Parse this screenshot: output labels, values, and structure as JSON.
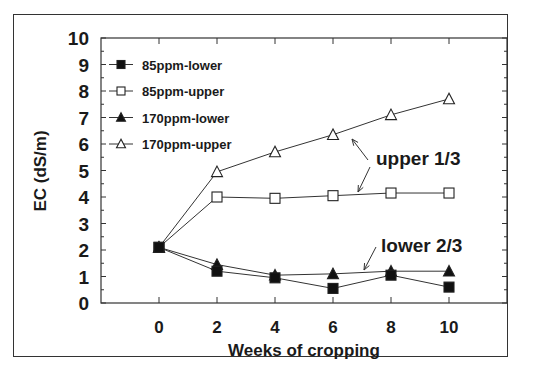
{
  "chart_data": {
    "type": "line",
    "title": "",
    "xlabel": "Weeks of cropping",
    "ylabel": "EC (dS/m)",
    "x": [
      0,
      2,
      4,
      6,
      8,
      10
    ],
    "xticks": [
      "0",
      "2",
      "4",
      "6",
      "8",
      "10"
    ],
    "yticks": [
      "0",
      "1",
      "2",
      "3",
      "4",
      "5",
      "6",
      "7",
      "8",
      "9",
      "10"
    ],
    "xlim": [
      -2.2,
      12
    ],
    "ylim": [
      0,
      10
    ],
    "grid": false,
    "legend_position": "upper left",
    "series": [
      {
        "name": "85ppm-lower",
        "marker": "filled-square",
        "values": [
          2.1,
          1.2,
          0.95,
          0.55,
          1.05,
          0.6
        ]
      },
      {
        "name": "85ppm-upper",
        "marker": "open-square",
        "values": [
          2.1,
          4.0,
          3.95,
          4.05,
          4.15,
          4.15
        ]
      },
      {
        "name": "170ppm-lower",
        "marker": "filled-triangle",
        "values": [
          2.1,
          1.45,
          1.05,
          1.1,
          1.2,
          1.2
        ]
      },
      {
        "name": "170ppm-upper",
        "marker": "open-triangle",
        "values": [
          2.1,
          4.95,
          5.7,
          6.35,
          7.1,
          7.7
        ]
      }
    ],
    "annotations": [
      {
        "text": "upper 1/3",
        "x": 8.4,
        "y": 5.2
      },
      {
        "text": "lower 2/3",
        "x": 8.1,
        "y": 2.2
      }
    ]
  },
  "colors": {
    "line": "#333333",
    "text": "#1a1a1a",
    "background": "#ffffff"
  }
}
